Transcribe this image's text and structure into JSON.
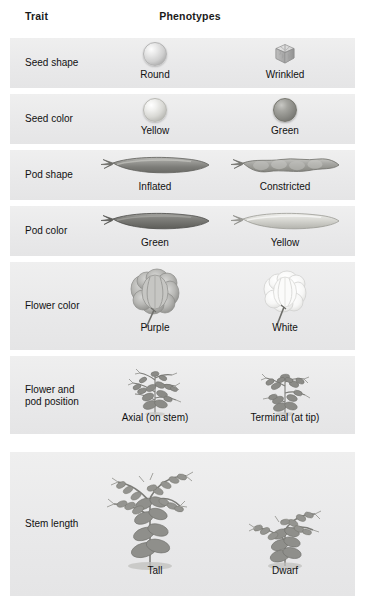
{
  "figure": {
    "headers": {
      "trait": "Trait",
      "phenotypes": "Phenotypes"
    },
    "colors": {
      "row_background": "#ececed",
      "page_background": "#ffffff",
      "text": "#111111",
      "header_text": "#1a1a1a"
    },
    "rows": [
      {
        "trait": "Seed shape",
        "icon_left": "round-seed-icon",
        "icon_right": "wrinkled-seed-icon",
        "left": "Round",
        "right": "Wrinkled"
      },
      {
        "trait": "Seed color",
        "icon_left": "yellow-seed-icon",
        "icon_right": "green-seed-icon",
        "left": "Yellow",
        "right": "Green"
      },
      {
        "trait": "Pod shape",
        "icon_left": "inflated-pod-icon",
        "icon_right": "constricted-pod-icon",
        "left": "Inflated",
        "right": "Constricted"
      },
      {
        "trait": "Pod color",
        "icon_left": "green-pod-icon",
        "icon_right": "yellow-pod-icon",
        "left": "Green",
        "right": "Yellow"
      },
      {
        "trait": "Flower color",
        "icon_left": "purple-flower-icon",
        "icon_right": "white-flower-icon",
        "left": "Purple",
        "right": "White"
      },
      {
        "trait": "Flower and\npod position",
        "icon_left": "axial-plant-icon",
        "icon_right": "terminal-plant-icon",
        "left": "Axial (on stem)",
        "right": "Terminal (at tip)"
      },
      {
        "trait": "Stem length",
        "icon_left": "tall-plant-icon",
        "icon_right": "dwarf-plant-icon",
        "left": "Tall",
        "right": "Dwarf"
      }
    ]
  }
}
